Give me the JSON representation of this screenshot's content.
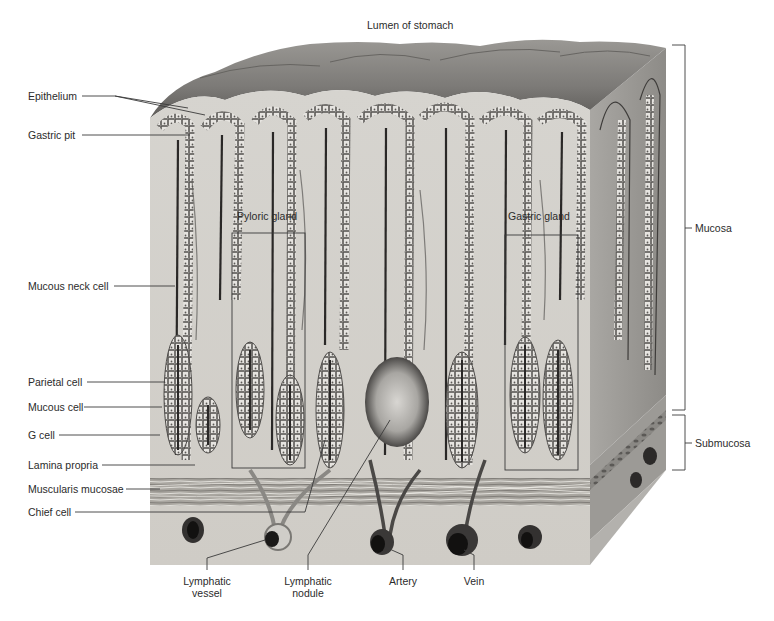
{
  "figure": {
    "title": "Lumen of stomach",
    "left_labels": [
      {
        "id": "epithelium",
        "text": "Epithelium"
      },
      {
        "id": "gastric-pit",
        "text": "Gastric pit"
      },
      {
        "id": "mucous-neck-cell",
        "text": "Mucous neck cell"
      },
      {
        "id": "parietal-cell",
        "text": "Parietal cell"
      },
      {
        "id": "mucous-cell",
        "text": "Mucous cell"
      },
      {
        "id": "g-cell",
        "text": "G cell"
      },
      {
        "id": "lamina-propria",
        "text": "Lamina propria"
      },
      {
        "id": "muscularis-mucosae",
        "text": "Muscularis mucosae"
      },
      {
        "id": "chief-cell",
        "text": "Chief cell"
      }
    ],
    "bottom_labels": [
      {
        "id": "lymphatic-vessel",
        "line1": "Lymphatic",
        "line2": "vessel"
      },
      {
        "id": "lymphatic-nodule",
        "line1": "Lymphatic",
        "line2": "nodule"
      },
      {
        "id": "artery",
        "line1": "Artery",
        "line2": ""
      },
      {
        "id": "vein",
        "line1": "Vein",
        "line2": ""
      }
    ],
    "right_labels": [
      {
        "id": "mucosa",
        "text": "Mucosa"
      },
      {
        "id": "submucosa",
        "text": "Submucosa"
      }
    ],
    "inner_labels": [
      {
        "id": "pyloric-gland",
        "text": "Pyloric gland"
      },
      {
        "id": "gastric-gland",
        "text": "Gastric gland"
      }
    ],
    "colors": {
      "tissue_light": "#d9d7d2",
      "tissue_mid": "#b8b6b1",
      "tissue_dark": "#6f6d6a",
      "cells": "#e8e6e2",
      "cell_outline": "#5a5856",
      "lumen_dark": "#2a2827",
      "leader_line": "#3a3a3a"
    }
  }
}
